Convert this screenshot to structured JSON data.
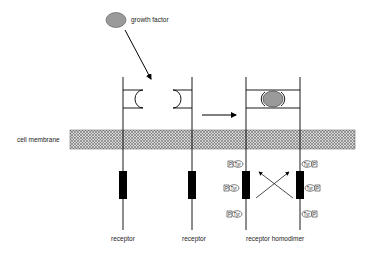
{
  "labels": {
    "growth_factor": "growth factor",
    "cell_membrane": "cell membrane",
    "receptor_1": "receptor",
    "receptor_2": "receptor",
    "receptor_homodimer": "receptor homodimer"
  },
  "phospho": {
    "p": "P",
    "tyr": "Tyr"
  },
  "colors": {
    "ligand_fill": "#9a9a9a",
    "membrane_fill": "#bdbdbd",
    "kinase_fill": "#000000",
    "line": "#000000"
  }
}
